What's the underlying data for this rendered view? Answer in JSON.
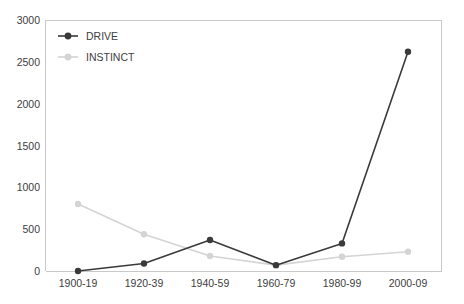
{
  "chart_data": {
    "type": "line",
    "title": "",
    "subtitle": "",
    "xlabel": "",
    "ylabel": "",
    "categories": [
      "1900-19",
      "1920-39",
      "1940-59",
      "1960-79",
      "1980-99",
      "2000-09"
    ],
    "series": [
      {
        "name": "DRIVE",
        "color": "#3a3a3a",
        "values": [
          0,
          90,
          370,
          70,
          330,
          2620
        ]
      },
      {
        "name": "INSTINCT",
        "color": "#d4d4d4",
        "values": [
          800,
          440,
          180,
          70,
          170,
          230
        ]
      }
    ],
    "ylim": [
      0,
      3000
    ],
    "ytick_step": 500,
    "ytick_labels": [
      "0",
      "500",
      "1000",
      "1500",
      "2000",
      "2500",
      "3000"
    ],
    "grid": false,
    "legend_position": "top-left-inside",
    "marker": "circle"
  },
  "legend": {
    "entries": [
      {
        "label": "DRIVE",
        "color": "#3a3a3a"
      },
      {
        "label": "INSTINCT",
        "color": "#d4d4d4"
      }
    ]
  },
  "axes": {
    "y_labels": [
      "3000",
      "2500",
      "2000",
      "1500",
      "1000",
      "500",
      "0"
    ],
    "x_labels": [
      "1900-19",
      "1920-39",
      "1940-59",
      "1960-79",
      "1980-99",
      "2000-09"
    ]
  },
  "colors": {
    "background": "#ffffff",
    "axis": "#c9c9c9",
    "frame": "#d8d8d8",
    "text": "#404040",
    "drive": "#3a3a3a",
    "instinct": "#d4d4d4"
  }
}
